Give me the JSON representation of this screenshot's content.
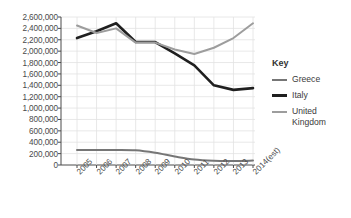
{
  "chart_data": {
    "type": "line",
    "title": "",
    "xlabel": "",
    "ylabel": "",
    "grid": true,
    "legend_position": "right",
    "legend_title": "Key",
    "ylim": [
      0,
      2600000
    ],
    "ytick_step": 200000,
    "categories": [
      "2005",
      "2006",
      "2007",
      "2008",
      "2009",
      "2010",
      "2011",
      "2012",
      "2013",
      "2014(est)"
    ],
    "ytick_labels": [
      "2,600,000",
      "2,400,000",
      "2,200,000",
      "2,000,000",
      "1,800,000",
      "1,600,000",
      "1,400,000",
      "1,200,000",
      "1,000,000",
      "800,000",
      "600,000",
      "400,000",
      "200,000",
      "0"
    ],
    "series": [
      {
        "name": "Greece",
        "color": "#767676",
        "width": 2.0,
        "smooth": true,
        "values": [
          265000,
          265000,
          265000,
          258000,
          215000,
          150000,
          95000,
          75000,
          72000,
          78000
        ]
      },
      {
        "name": "Italy",
        "color": "#1f1f1f",
        "width": 2.6,
        "smooth": false,
        "values": [
          2230000,
          2350000,
          2490000,
          2160000,
          2160000,
          1960000,
          1750000,
          1400000,
          1320000,
          1350000
        ]
      },
      {
        "name": "United Kingdom",
        "color": "#9d9d9d",
        "width": 2.0,
        "smooth": false,
        "values": [
          2450000,
          2320000,
          2400000,
          2150000,
          2150000,
          2030000,
          1950000,
          2060000,
          2230000,
          2490000
        ]
      }
    ]
  },
  "legend": {
    "title": "Key",
    "items": [
      {
        "label": "Greece",
        "color": "#767676"
      },
      {
        "label": "Italy",
        "color": "#1f1f1f"
      },
      {
        "label": "United Kingdom",
        "color": "#9d9d9d"
      }
    ]
  },
  "axes": {
    "axis_color": "#4a4a4a",
    "grid_color": "#e2e2e2"
  }
}
